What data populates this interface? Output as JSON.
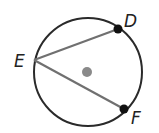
{
  "diagram": {
    "circle": {
      "cx": 88,
      "cy": 72,
      "r": 54,
      "stroke": "#2a2a2a"
    },
    "center_dot": {
      "cx": 87,
      "cy": 72,
      "r": 5,
      "color": "#8a8a8a"
    },
    "points": {
      "D": {
        "label": "D",
        "x": 118,
        "y": 29,
        "lx": 124,
        "ly": 27
      },
      "E": {
        "label": "E",
        "x": 34,
        "y": 60,
        "lx": 14,
        "ly": 66
      },
      "F": {
        "label": "F",
        "x": 124,
        "y": 109,
        "lx": 131,
        "ly": 121
      }
    },
    "chords": [
      {
        "from": "E",
        "to": "D",
        "color": "#707070"
      },
      {
        "from": "E",
        "to": "F",
        "color": "#707070"
      }
    ]
  }
}
